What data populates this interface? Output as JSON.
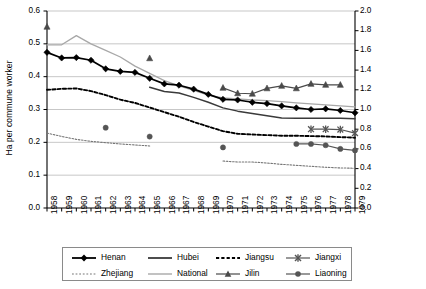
{
  "chart_data": {
    "type": "line",
    "title": "",
    "xlabel": "",
    "ylabel": "Ha per commune worker",
    "ylabel_right": "Ha per commune worker (Liaoning and Jilin)",
    "x": [
      1958,
      1959,
      1960,
      1961,
      1962,
      1963,
      1964,
      1965,
      1966,
      1967,
      1968,
      1969,
      1970,
      1971,
      1972,
      1973,
      1974,
      1975,
      1976,
      1977,
      1978,
      1979
    ],
    "categories": [
      "1958",
      "1959",
      "1960",
      "1961",
      "1962",
      "1963",
      "1964",
      "1965",
      "1966",
      "1967",
      "1968",
      "1969",
      "1970",
      "1971",
      "1972",
      "1973",
      "1974",
      "1975",
      "1976",
      "1977",
      "1978",
      "1979"
    ],
    "ylim": [
      0.0,
      0.6
    ],
    "yticks": [
      "0.0",
      "0.1",
      "0.2",
      "0.3",
      "0.4",
      "0.5",
      "0.6"
    ],
    "ylim_right": [
      0.0,
      2.0
    ],
    "yticks_right": [
      "0.0",
      "0.2",
      "0.4",
      "0.6",
      "0.8",
      "1.0",
      "1.2",
      "1.4",
      "1.6",
      "1.8",
      "2.0"
    ],
    "grid": "horizontal",
    "legend_position": "bottom",
    "series": [
      {
        "name": "Henan",
        "axis": "left",
        "style": "solid-thick-marker",
        "marker": "diamond",
        "color": "#000000",
        "x": [
          1958,
          1959,
          1960,
          1961,
          1962,
          1963,
          1964,
          1965,
          1966,
          1967,
          1968,
          1969,
          1970,
          1971,
          1972,
          1973,
          1974,
          1975,
          1976,
          1977,
          1978,
          1979
        ],
        "values": [
          0.474,
          0.457,
          0.458,
          0.45,
          0.424,
          0.416,
          0.413,
          0.395,
          0.378,
          0.374,
          0.362,
          0.346,
          0.331,
          0.329,
          0.322,
          0.318,
          0.311,
          0.305,
          0.3,
          0.302,
          0.297,
          0.29
        ]
      },
      {
        "name": "Hubei",
        "axis": "left",
        "style": "solid",
        "marker": "none",
        "color": "#3a3a3a",
        "x": [
          1965,
          1966,
          1967,
          1968,
          1969,
          1970,
          1971,
          1972,
          1973,
          1974,
          1975,
          1976,
          1977,
          1978,
          1979
        ],
        "values": [
          0.368,
          0.355,
          0.35,
          0.337,
          0.322,
          0.305,
          0.295,
          0.288,
          0.281,
          0.274,
          0.273,
          0.273,
          0.273,
          0.273,
          0.272
        ]
      },
      {
        "name": "Jiangsu",
        "axis": "left",
        "style": "dashed-thick",
        "marker": "none",
        "color": "#000000",
        "x": [
          1958,
          1959,
          1960,
          1961,
          1962,
          1963,
          1964,
          1965,
          1966,
          1967,
          1968,
          1969,
          1970,
          1971,
          1972,
          1973,
          1974,
          1975,
          1976,
          1977,
          1978,
          1979
        ],
        "values": [
          0.36,
          0.363,
          0.364,
          0.356,
          0.344,
          0.33,
          0.32,
          0.306,
          0.292,
          0.278,
          0.262,
          0.248,
          0.234,
          0.226,
          0.224,
          0.222,
          0.22,
          0.22,
          0.219,
          0.218,
          0.216,
          0.214
        ]
      },
      {
        "name": "Jiangxi",
        "axis": "left",
        "style": "solid-marker",
        "marker": "x-cross",
        "color": "#555555",
        "x": [
          1976,
          1977,
          1978,
          1979
        ],
        "values": [
          0.24,
          0.24,
          0.239,
          0.228
        ]
      },
      {
        "name": "Zhejiang",
        "axis": "left",
        "style": "dotted",
        "marker": "none",
        "color": "#777777",
        "x": [
          1958,
          1959,
          1960,
          1961,
          1962,
          1963,
          1964,
          1965,
          1970,
          1971,
          1972,
          1973,
          1974,
          1975,
          1976,
          1977,
          1978,
          1979
        ],
        "values": [
          0.228,
          0.218,
          0.209,
          0.203,
          0.199,
          0.195,
          0.192,
          0.189,
          0.143,
          0.14,
          0.14,
          0.137,
          0.133,
          0.13,
          0.127,
          0.124,
          0.122,
          0.121
        ]
      },
      {
        "name": "National",
        "axis": "left",
        "style": "solid-light",
        "marker": "none",
        "color": "#a8a8a8",
        "x": [
          1958,
          1959,
          1960,
          1961,
          1962,
          1963,
          1964,
          1965,
          1966,
          1967,
          1968,
          1969,
          1970,
          1971,
          1972,
          1973,
          1974,
          1975,
          1976,
          1977,
          1978,
          1979
        ],
        "values": [
          0.497,
          0.497,
          0.525,
          0.5,
          0.48,
          0.46,
          0.432,
          0.41,
          0.388,
          0.372,
          0.358,
          0.344,
          0.335,
          0.332,
          0.329,
          0.327,
          0.324,
          0.32,
          0.317,
          0.314,
          0.311,
          0.308
        ]
      },
      {
        "name": "Jilin",
        "axis": "right",
        "style": "solid-marker",
        "marker": "triangle",
        "color": "#4a4a4a",
        "x": [
          1958,
          1965,
          1970,
          1971,
          1972,
          1973,
          1974,
          1975,
          1976,
          1977,
          1978
        ],
        "values": [
          1.84,
          1.52,
          1.22,
          1.165,
          1.16,
          1.215,
          1.24,
          1.215,
          1.26,
          1.25,
          1.25
        ]
      },
      {
        "name": "Liaoning",
        "axis": "right",
        "style": "solid-marker",
        "marker": "circle",
        "color": "#555555",
        "x": [
          1962,
          1965,
          1970,
          1975,
          1976,
          1977,
          1978,
          1979
        ],
        "values": [
          0.815,
          0.725,
          0.615,
          0.65,
          0.65,
          0.637,
          0.6,
          0.585
        ]
      }
    ],
    "legend": [
      {
        "label": "Henan",
        "swatch": "solid-thick-diamond"
      },
      {
        "label": "Hubei",
        "swatch": "solid"
      },
      {
        "label": "Jiangsu",
        "swatch": "dashed-thick"
      },
      {
        "label": "Jiangxi",
        "swatch": "solid-xcross"
      },
      {
        "label": "Zhejiang",
        "swatch": "dotted"
      },
      {
        "label": "National",
        "swatch": "solid-light"
      },
      {
        "label": "Jilin",
        "swatch": "solid-triangle"
      },
      {
        "label": "Liaoning",
        "swatch": "solid-circle"
      }
    ],
    "colors": {
      "henan": "#000000",
      "hubei": "#3a3a3a",
      "jiangsu": "#000000",
      "jiangxi": "#555555",
      "zhejiang": "#777777",
      "national": "#a8a8a8",
      "jilin": "#4a4a4a",
      "liaoning": "#555555",
      "grid": "#b9b9b9",
      "axis": "#000000"
    }
  }
}
